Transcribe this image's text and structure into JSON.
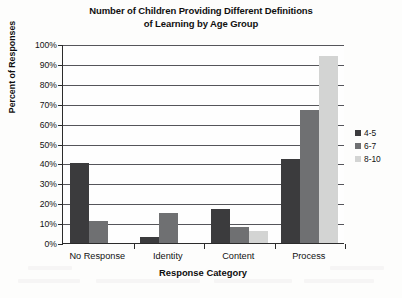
{
  "chart_data": {
    "type": "bar",
    "title": "Number of Children Providing Different Definitions of Learning by Age Group",
    "title_line1": "Number of Children Providing Different Definitions",
    "title_line2": "of Learning by Age Group",
    "xlabel": "Response Category",
    "ylabel": "Percent of Responses",
    "categories": [
      "No Response",
      "Identity",
      "Content",
      "Process"
    ],
    "series": [
      {
        "name": "4-5",
        "color": "#3b3b3d",
        "values": [
          40,
          3,
          17,
          42
        ]
      },
      {
        "name": "6-7",
        "color": "#6f7072",
        "values": [
          11,
          15,
          8,
          67
        ]
      },
      {
        "name": "8-10",
        "color": "#d3d4d3",
        "values": [
          0,
          0,
          6,
          94
        ]
      }
    ],
    "ylim": [
      0,
      100
    ],
    "ytick_step": 10,
    "ytick_labels": [
      "100%",
      "90%",
      "80%",
      "70%",
      "60%",
      "50%",
      "40%",
      "30%",
      "20%",
      "10%",
      "0%"
    ],
    "ytick_values": [
      100,
      90,
      80,
      70,
      60,
      50,
      40,
      30,
      20,
      10,
      0
    ],
    "grid": true,
    "legend_position": "right"
  }
}
